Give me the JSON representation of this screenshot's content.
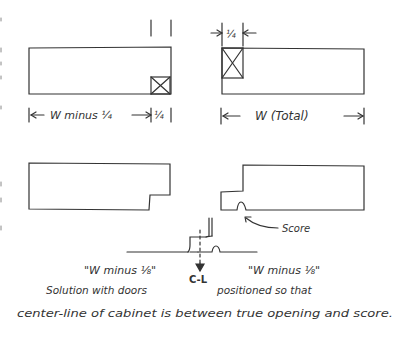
{
  "diagram": {
    "type": "cabinet-door-layout-sketch",
    "top_left": {
      "dim_label": "W minus ¼",
      "dim_small": "¼"
    },
    "top_right": {
      "dim_small": "¼",
      "dim_label": "W (Total)"
    },
    "bottom_right": {
      "callout": "Score"
    },
    "center": {
      "centerline_label": "C-L"
    },
    "bottom_labels": {
      "left": "\"W minus ⅛\"",
      "right": "\"W minus ⅛\""
    },
    "caption": {
      "line1a": "Solution with doors",
      "line1b": "positioned so that",
      "line2": "center-line of cabinet is between true opening and score."
    }
  },
  "colors": {
    "ink": "#333333",
    "background": "#ffffff"
  }
}
